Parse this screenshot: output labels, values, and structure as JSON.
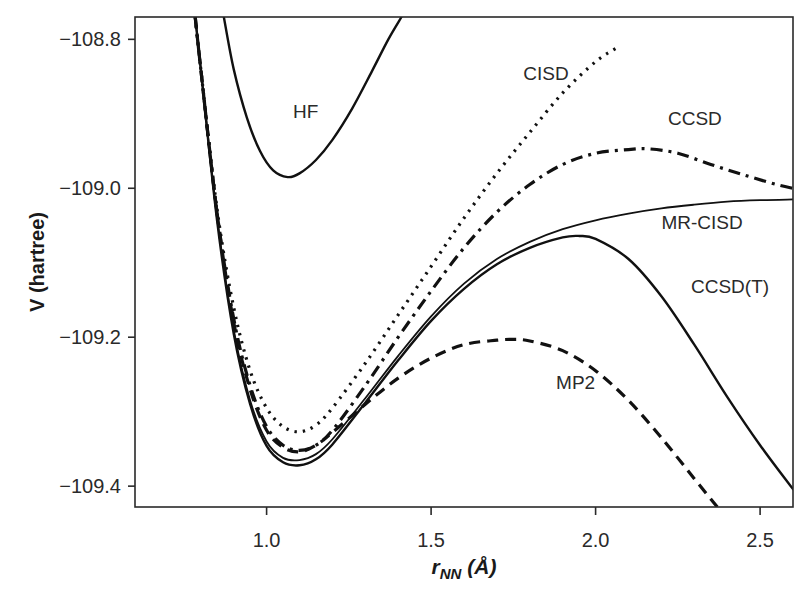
{
  "chart_data": {
    "type": "line",
    "title": "",
    "xlabel": "r_NN (Å)",
    "xlabel_parts": {
      "main": "r",
      "sub": "NN",
      "unit": " (Å)"
    },
    "ylabel": "V (hartree)",
    "xlim": [
      0.6,
      2.6
    ],
    "ylim": [
      -109.428,
      -108.77
    ],
    "xticks": [
      1.0,
      1.5,
      2.0,
      2.5
    ],
    "xtick_labels": [
      "1.0",
      "1.5",
      "2.0",
      "2.5"
    ],
    "yticks": [
      -108.8,
      -109.0,
      -109.2,
      -109.4
    ],
    "ytick_labels": [
      "−108.8",
      "−109.0",
      "−109.2",
      "−109.4"
    ],
    "grid": false,
    "legend": "inline labels",
    "series": [
      {
        "name": "HF",
        "style": "solid",
        "width": 2.4,
        "label_pos": [
          1.08,
          -108.905
        ],
        "x": [
          0.87,
          0.9,
          0.94,
          0.98,
          1.02,
          1.064,
          1.1,
          1.15,
          1.2,
          1.26,
          1.32,
          1.37,
          1.41
        ],
        "y": [
          -108.77,
          -108.84,
          -108.905,
          -108.95,
          -108.976,
          -108.985,
          -108.98,
          -108.962,
          -108.935,
          -108.893,
          -108.843,
          -108.8,
          -108.77
        ]
      },
      {
        "name": "CISD",
        "style": "dotted",
        "width": 3.2,
        "label_pos": [
          1.78,
          -108.855
        ],
        "x": [
          0.783,
          0.8,
          0.85,
          0.9,
          0.95,
          1.0,
          1.05,
          1.1,
          1.15,
          1.2,
          1.3,
          1.4,
          1.5,
          1.6,
          1.7,
          1.8,
          1.9,
          2.0,
          2.07
        ],
        "y": [
          -108.77,
          -108.84,
          -109.03,
          -109.16,
          -109.245,
          -109.295,
          -109.32,
          -109.327,
          -109.318,
          -109.295,
          -109.235,
          -109.17,
          -109.105,
          -109.04,
          -108.98,
          -108.925,
          -108.872,
          -108.83,
          -108.81
        ]
      },
      {
        "name": "CCSD",
        "style": "dashdot",
        "width": 3.2,
        "label_pos": [
          2.22,
          -108.915
        ],
        "x": [
          0.783,
          0.8,
          0.85,
          0.9,
          0.95,
          1.0,
          1.05,
          1.1,
          1.15,
          1.2,
          1.3,
          1.4,
          1.5,
          1.6,
          1.7,
          1.8,
          1.9,
          2.0,
          2.1,
          2.16,
          2.25,
          2.35,
          2.45,
          2.55,
          2.6
        ],
        "y": [
          -108.77,
          -108.84,
          -109.035,
          -109.175,
          -109.265,
          -109.32,
          -109.345,
          -109.352,
          -109.345,
          -109.325,
          -109.265,
          -109.2,
          -109.138,
          -109.08,
          -109.032,
          -108.995,
          -108.968,
          -108.953,
          -108.948,
          -108.947,
          -108.953,
          -108.968,
          -108.982,
          -108.995,
          -109.0
        ]
      },
      {
        "name": "MP2",
        "style": "dashed",
        "width": 3.2,
        "label_pos": [
          1.88,
          -109.27
        ],
        "x": [
          0.783,
          0.8,
          0.85,
          0.9,
          0.95,
          1.0,
          1.05,
          1.1,
          1.15,
          1.2,
          1.3,
          1.4,
          1.5,
          1.6,
          1.7,
          1.75,
          1.8,
          1.9,
          2.0,
          2.1,
          2.2,
          2.3,
          2.37
        ],
        "y": [
          -108.77,
          -108.84,
          -109.035,
          -109.18,
          -109.27,
          -109.325,
          -109.348,
          -109.354,
          -109.345,
          -109.328,
          -109.29,
          -109.255,
          -109.228,
          -109.21,
          -109.204,
          -109.203,
          -109.205,
          -109.218,
          -109.245,
          -109.285,
          -109.335,
          -109.39,
          -109.428
        ]
      },
      {
        "name": "MR-CISD",
        "style": "solid",
        "width": 1.8,
        "label_pos": [
          2.2,
          -109.055
        ],
        "x": [
          0.783,
          0.8,
          0.85,
          0.9,
          0.95,
          1.0,
          1.05,
          1.1,
          1.15,
          1.2,
          1.3,
          1.4,
          1.5,
          1.6,
          1.7,
          1.8,
          1.9,
          2.0,
          2.1,
          2.2,
          2.3,
          2.4,
          2.5,
          2.6
        ],
        "y": [
          -108.77,
          -108.84,
          -109.04,
          -109.19,
          -109.285,
          -109.34,
          -109.362,
          -109.365,
          -109.357,
          -109.337,
          -109.282,
          -109.225,
          -109.172,
          -109.128,
          -109.095,
          -109.072,
          -109.055,
          -109.043,
          -109.034,
          -109.027,
          -109.022,
          -109.018,
          -109.016,
          -109.015
        ]
      },
      {
        "name": "CCSD(T)",
        "style": "solid",
        "width": 2.4,
        "label_pos": [
          2.29,
          -109.14
        ],
        "x": [
          0.783,
          0.8,
          0.85,
          0.9,
          0.95,
          1.0,
          1.05,
          1.1,
          1.15,
          1.2,
          1.3,
          1.4,
          1.5,
          1.6,
          1.7,
          1.8,
          1.9,
          1.95,
          2.0,
          2.1,
          2.2,
          2.3,
          2.4,
          2.5,
          2.6
        ],
        "y": [
          -108.77,
          -108.84,
          -109.045,
          -109.195,
          -109.29,
          -109.346,
          -109.368,
          -109.372,
          -109.364,
          -109.344,
          -109.288,
          -109.231,
          -109.178,
          -109.135,
          -109.102,
          -109.08,
          -109.066,
          -109.064,
          -109.068,
          -109.095,
          -109.145,
          -109.21,
          -109.28,
          -109.345,
          -109.404
        ]
      }
    ]
  },
  "layout": {
    "plot_px": {
      "left": 135,
      "right": 793,
      "top": 17,
      "bottom": 507
    }
  }
}
